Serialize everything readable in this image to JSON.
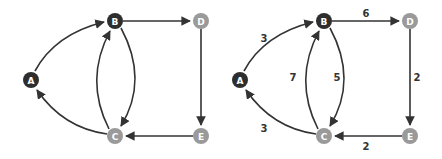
{
  "colors": {
    "visited": "#2e2e2e",
    "unvisited": "#9a9a9a",
    "edge": "#333333",
    "label": "#ffffff",
    "weight": "#333333"
  },
  "graphs": [
    {
      "name": "unweighted-graph",
      "offset_x": 0,
      "nodes": [
        {
          "id": "A",
          "label": "A",
          "x": 31,
          "y": 80,
          "state": "visited"
        },
        {
          "id": "B",
          "label": "B",
          "x": 115,
          "y": 21,
          "state": "visited"
        },
        {
          "id": "D",
          "label": "D",
          "x": 201,
          "y": 21,
          "state": "unvisited"
        },
        {
          "id": "C",
          "label": "C",
          "x": 115,
          "y": 136,
          "state": "unvisited"
        },
        {
          "id": "E",
          "label": "E",
          "x": 201,
          "y": 136,
          "state": "unvisited"
        }
      ],
      "edges": [
        {
          "from": "A",
          "to": "B",
          "weight": ""
        },
        {
          "from": "B",
          "to": "D",
          "weight": ""
        },
        {
          "from": "D",
          "to": "E",
          "weight": ""
        },
        {
          "from": "E",
          "to": "C",
          "weight": ""
        },
        {
          "from": "C",
          "to": "A",
          "weight": ""
        },
        {
          "from": "B",
          "to": "C",
          "weight": ""
        },
        {
          "from": "C",
          "to": "B",
          "weight": ""
        }
      ]
    },
    {
      "name": "weighted-graph",
      "offset_x": 209,
      "nodes": [
        {
          "id": "A",
          "label": "A",
          "x": 31,
          "y": 80,
          "state": "visited"
        },
        {
          "id": "B",
          "label": "B",
          "x": 115,
          "y": 21,
          "state": "visited"
        },
        {
          "id": "D",
          "label": "D",
          "x": 201,
          "y": 21,
          "state": "unvisited"
        },
        {
          "id": "C",
          "label": "C",
          "x": 115,
          "y": 136,
          "state": "unvisited"
        },
        {
          "id": "E",
          "label": "E",
          "x": 201,
          "y": 136,
          "state": "unvisited"
        }
      ],
      "edges": [
        {
          "from": "A",
          "to": "B",
          "weight": "3"
        },
        {
          "from": "B",
          "to": "D",
          "weight": "6"
        },
        {
          "from": "D",
          "to": "E",
          "weight": "2"
        },
        {
          "from": "E",
          "to": "C",
          "weight": "2"
        },
        {
          "from": "C",
          "to": "A",
          "weight": "3"
        },
        {
          "from": "B",
          "to": "C",
          "weight": "5"
        },
        {
          "from": "C",
          "to": "B",
          "weight": "7"
        }
      ]
    }
  ]
}
